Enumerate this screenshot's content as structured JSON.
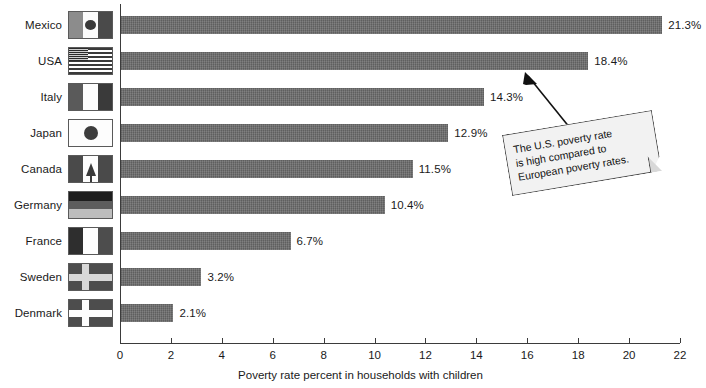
{
  "chart_data": {
    "type": "bar",
    "orientation": "horizontal",
    "title": "",
    "xlabel": "Poverty rate percent in households with children",
    "ylabel": "",
    "xlim": [
      0,
      22
    ],
    "xticks": [
      0,
      2,
      4,
      6,
      8,
      10,
      12,
      14,
      16,
      18,
      20,
      22
    ],
    "grid": false,
    "legend": false,
    "categories": [
      "Mexico",
      "USA",
      "Italy",
      "Japan",
      "Canada",
      "Germany",
      "France",
      "Sweden",
      "Denmark"
    ],
    "values": [
      21.3,
      18.4,
      14.3,
      12.9,
      11.5,
      10.4,
      6.7,
      3.2,
      2.1
    ],
    "value_labels": [
      "21.3%",
      "18.4%",
      "14.3%",
      "12.9%",
      "11.5%",
      "10.4%",
      "6.7%",
      "3.2%",
      "2.1%"
    ],
    "bar_color": "#686868",
    "annotations": [
      {
        "text": "The U.S. poverty rate is high compared to European poverty rates.",
        "lines": [
          "The U.S. poverty rate",
          "is high compared to",
          "European poverty rates."
        ],
        "points_at": "USA"
      }
    ]
  },
  "axis": {
    "x_title": "Poverty rate percent in households with children",
    "tick_labels": [
      "0",
      "2",
      "4",
      "6",
      "8",
      "10",
      "12",
      "14",
      "16",
      "18",
      "20",
      "22"
    ]
  },
  "rows": [
    {
      "country": "Mexico",
      "value_label": "21.3%",
      "flag": "flag-mexico"
    },
    {
      "country": "USA",
      "value_label": "18.4%",
      "flag": "flag-usa"
    },
    {
      "country": "Italy",
      "value_label": "14.3%",
      "flag": "flag-italy"
    },
    {
      "country": "Japan",
      "value_label": "12.9%",
      "flag": "flag-japan"
    },
    {
      "country": "Canada",
      "value_label": "11.5%",
      "flag": "flag-canada"
    },
    {
      "country": "Germany",
      "value_label": "10.4%",
      "flag": "flag-germany"
    },
    {
      "country": "France",
      "value_label": "6.7%",
      "flag": "flag-france"
    },
    {
      "country": "Sweden",
      "value_label": "3.2%",
      "flag": "flag-sweden"
    },
    {
      "country": "Denmark",
      "value_label": "2.1%",
      "flag": "flag-denmark"
    }
  ],
  "callout": {
    "line1": "The U.S. poverty rate",
    "line2": "is high compared to",
    "line3": "European poverty rates."
  }
}
